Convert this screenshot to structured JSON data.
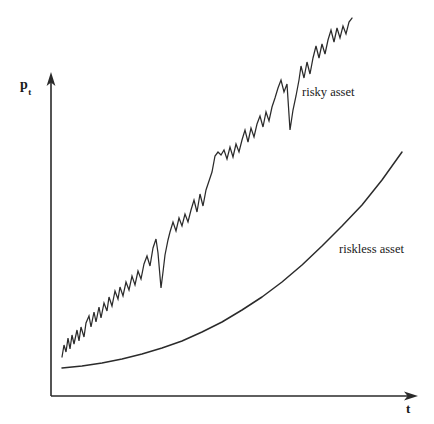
{
  "figure": {
    "background_color": "#ffffff",
    "ink_color": "#2b2b2b",
    "axis_origin_px": [
      51,
      396
    ],
    "y_axis_top_px": [
      51,
      74
    ],
    "x_axis_right_px": [
      417,
      396
    ]
  },
  "labels": {
    "y_axis_symbol": "p",
    "y_axis_subscript": "t",
    "x_axis_symbol": "t",
    "risky_label": "risky asset",
    "riskless_label": "riskless asset"
  },
  "chart_data": {
    "type": "line",
    "title": "",
    "subtitle": "",
    "xlabel": "t",
    "ylabel": "p_t",
    "grid": false,
    "legend_position": "inline-annotations",
    "annotations": [
      {
        "text": "risky asset",
        "x_px": 302,
        "y_px": 86
      },
      {
        "text": "riskless asset",
        "x_px": 339,
        "y_px": 243
      }
    ],
    "axis_style": "arrowed-open-axes-no-ticks",
    "xlim": [
      0,
      1
    ],
    "ylim": [
      0,
      1
    ],
    "x_tick_labels": [],
    "y_tick_labels": [],
    "series": [
      {
        "name": "risky asset",
        "style": "jagged random walk with upward drift",
        "color": "#2b2b2b",
        "points_px": [
          [
            62,
            357
          ],
          [
            64,
            345
          ],
          [
            66,
            352
          ],
          [
            68,
            338
          ],
          [
            70,
            349
          ],
          [
            72,
            335
          ],
          [
            74,
            344
          ],
          [
            77,
            330
          ],
          [
            79,
            341
          ],
          [
            81,
            327
          ],
          [
            84,
            337
          ],
          [
            86,
            323
          ],
          [
            89,
            316
          ],
          [
            91,
            327
          ],
          [
            94,
            312
          ],
          [
            96,
            322
          ],
          [
            99,
            307
          ],
          [
            101,
            318
          ],
          [
            104,
            303
          ],
          [
            107,
            311
          ],
          [
            109,
            297
          ],
          [
            112,
            306
          ],
          [
            115,
            291
          ],
          [
            118,
            299
          ],
          [
            120,
            287
          ],
          [
            123,
            296
          ],
          [
            126,
            282
          ],
          [
            129,
            290
          ],
          [
            132,
            276
          ],
          [
            135,
            285
          ],
          [
            138,
            271
          ],
          [
            141,
            279
          ],
          [
            144,
            264
          ],
          [
            147,
            256
          ],
          [
            150,
            266
          ],
          [
            153,
            248
          ],
          [
            156,
            239
          ],
          [
            158,
            253
          ],
          [
            161,
            288
          ],
          [
            163,
            272
          ],
          [
            165,
            255
          ],
          [
            168,
            240
          ],
          [
            170,
            232
          ],
          [
            173,
            222
          ],
          [
            176,
            231
          ],
          [
            179,
            218
          ],
          [
            182,
            226
          ],
          [
            185,
            214
          ],
          [
            188,
            222
          ],
          [
            191,
            210
          ],
          [
            194,
            200
          ],
          [
            197,
            212
          ],
          [
            200,
            194
          ],
          [
            203,
            206
          ],
          [
            206,
            190
          ],
          [
            209,
            181
          ],
          [
            212,
            172
          ],
          [
            215,
            156
          ],
          [
            218,
            152
          ],
          [
            221,
            155
          ],
          [
            224,
            150
          ],
          [
            227,
            159
          ],
          [
            230,
            147
          ],
          [
            233,
            157
          ],
          [
            236,
            144
          ],
          [
            239,
            152
          ],
          [
            242,
            140
          ],
          [
            245,
            130
          ],
          [
            248,
            142
          ],
          [
            251,
            128
          ],
          [
            254,
            137
          ],
          [
            257,
            124
          ],
          [
            260,
            116
          ],
          [
            263,
            127
          ],
          [
            266,
            112
          ],
          [
            269,
            121
          ],
          [
            272,
            107
          ],
          [
            275,
            98
          ],
          [
            278,
            88
          ],
          [
            281,
            80
          ],
          [
            284,
            92
          ],
          [
            287,
            84
          ],
          [
            290,
            130
          ],
          [
            293,
            110
          ],
          [
            296,
            96
          ],
          [
            299,
            80
          ],
          [
            301,
            66
          ],
          [
            304,
            78
          ],
          [
            307,
            62
          ],
          [
            310,
            74
          ],
          [
            313,
            58
          ],
          [
            316,
            46
          ],
          [
            319,
            58
          ],
          [
            322,
            44
          ],
          [
            325,
            54
          ],
          [
            328,
            40
          ],
          [
            331,
            30
          ],
          [
            334,
            42
          ],
          [
            337,
            28
          ],
          [
            340,
            38
          ],
          [
            343,
            26
          ],
          [
            346,
            34
          ],
          [
            349,
            22
          ],
          [
            352,
            18
          ]
        ]
      },
      {
        "name": "riskless asset",
        "style": "smooth exponential growth",
        "color": "#2b2b2b",
        "points_px": [
          [
            62,
            368
          ],
          [
            82,
            366
          ],
          [
            102,
            363
          ],
          [
            122,
            359
          ],
          [
            142,
            354
          ],
          [
            162,
            348
          ],
          [
            182,
            341
          ],
          [
            202,
            332
          ],
          [
            222,
            322
          ],
          [
            242,
            310
          ],
          [
            262,
            297
          ],
          [
            282,
            282
          ],
          [
            302,
            265
          ],
          [
            322,
            246
          ],
          [
            342,
            226
          ],
          [
            362,
            205
          ],
          [
            382,
            180
          ],
          [
            402,
            152
          ]
        ]
      }
    ]
  }
}
